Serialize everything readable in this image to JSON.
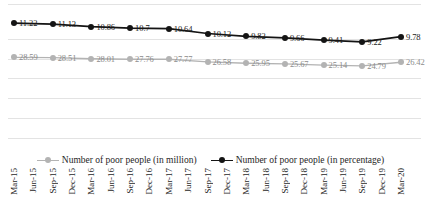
{
  "chart_data": {
    "type": "line",
    "title": "",
    "subtitle": "",
    "xlabel": "",
    "ylabel": "",
    "grid": true,
    "legend_position": "bottom",
    "categories": [
      "Mar-15",
      "Jun-15",
      "Sep-15",
      "Dec-15",
      "Mar-16",
      "Jun-16",
      "Sep-16",
      "Dec-16",
      "Mar-17",
      "Jun-17",
      "Sep-17",
      "Dec-17",
      "Mar-18",
      "Jun-18",
      "Sep-18",
      "Dec-18",
      "Mar-19",
      "Jun-19",
      "Sep-19",
      "Dec-19",
      "Mar-20"
    ],
    "series": [
      {
        "name": "Number of poor people (in million)",
        "color": "#b3b3b3",
        "values": [
          28.59,
          null,
          28.51,
          null,
          28.01,
          null,
          27.76,
          null,
          27.77,
          null,
          26.58,
          null,
          25.95,
          null,
          25.67,
          null,
          25.14,
          null,
          24.79,
          null,
          26.42
        ],
        "labels": [
          "28.59",
          "",
          "28.51",
          "",
          "28.01",
          "",
          "27.76",
          "",
          "27.77",
          "",
          "26.58",
          "",
          "25.95",
          "",
          "25.67",
          "",
          "25.14",
          "",
          "24.79",
          "",
          "26.42"
        ]
      },
      {
        "name": "Number of poor people (in percentage)",
        "color": "#141414",
        "values": [
          11.22,
          null,
          11.13,
          null,
          10.86,
          null,
          10.7,
          null,
          10.64,
          null,
          10.12,
          null,
          9.82,
          null,
          9.66,
          null,
          9.41,
          null,
          9.22,
          null,
          9.78
        ],
        "labels": [
          "11.22",
          "",
          "11.13",
          "",
          "10.86",
          "",
          "10.7",
          "",
          "10.64",
          "",
          "10.12",
          "",
          "9.82",
          "",
          "9.66",
          "",
          "9.41",
          "",
          "9.22",
          "",
          "9.78"
        ]
      }
    ]
  },
  "legend": {
    "items": [
      {
        "label": "Number of poor people (in million)",
        "key": "gray-line-marker-key"
      },
      {
        "label": "Number of poor people (in percentage)",
        "key": "dark-line-marker-key"
      }
    ]
  }
}
